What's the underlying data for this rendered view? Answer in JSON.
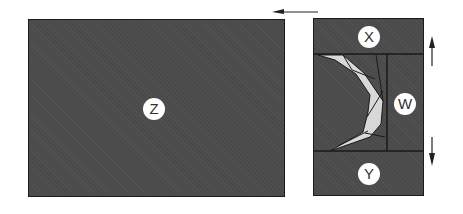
{
  "regions": {
    "z": {
      "label": "Z"
    },
    "x": {
      "label": "X"
    },
    "w": {
      "label": "W"
    },
    "y": {
      "label": "Y"
    }
  },
  "arrows": {
    "top": {
      "direction": "left"
    },
    "right_upper": {
      "direction": "up"
    },
    "right_lower": {
      "direction": "down"
    }
  },
  "colors": {
    "panel_fill": "#4a4a4a",
    "panel_border": "#1a1a1a",
    "crescent_fill": "#d8d8d8",
    "label_bg": "#ffffff"
  }
}
